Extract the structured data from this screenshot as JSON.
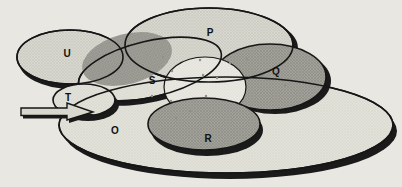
{
  "diagram": {
    "colors": {
      "paper": "#e8e7e1",
      "outline": "#161616",
      "shadow": "#1a1a1a",
      "label": "#111111",
      "speck": "#90908a",
      "arrow_fill": "#d8d8cf"
    },
    "patterns": {
      "hatchFaint": {
        "bg": "#e2e2da",
        "line": "#d8d8cf"
      },
      "hatchLight": {
        "bg": "#d8d8d0",
        "line": "#c8c8bd"
      },
      "hatchDark": {
        "bg": "#a2a29a",
        "line": "#8c8c83"
      },
      "hatchCenter": {
        "bg": "#e9e9e2",
        "line": "#e0e0d8"
      }
    },
    "sets": [
      {
        "id": "O",
        "label": "O",
        "phase": 1,
        "cx": 226,
        "cy": 125,
        "rx": 167,
        "ry": 48,
        "rot": 0,
        "fill": "hatchFaint",
        "stroke": true,
        "sw": 1.6,
        "shadow": {
          "dx": 4,
          "dy": 6
        },
        "label_x": 115,
        "label_y": 130
      },
      {
        "id": "U",
        "label": "U",
        "phase": 1,
        "cx": 70,
        "cy": 57,
        "rx": 53,
        "ry": 27,
        "rot": 0,
        "fill": "hatchLight",
        "stroke": true,
        "sw": 1.6,
        "shadow": {
          "dx": 2,
          "dy": 5
        },
        "label_x": 67,
        "label_y": 53
      },
      {
        "id": "S",
        "label": "S",
        "phase": 1,
        "cx": 150,
        "cy": 69,
        "rx": 73,
        "ry": 28,
        "rot": -13,
        "fill": "hatchFaint",
        "stroke": true,
        "sw": 1.6,
        "shadow": {
          "dx": 1,
          "dy": 5
        },
        "label_x": 152,
        "label_y": 80
      },
      {
        "id": "P",
        "label": "P",
        "phase": 1,
        "cx": 209,
        "cy": 45,
        "rx": 84,
        "ry": 37,
        "rot": 0,
        "fill": "hatchLight",
        "stroke": true,
        "sw": 1.6,
        "shadow": {
          "dx": 5,
          "dy": 3
        },
        "label_x": 210,
        "label_y": 32
      },
      {
        "id": "lens",
        "label": "",
        "phase": 1,
        "cx": 127,
        "cy": 59,
        "rx": 46,
        "ry": 25,
        "rot": -15,
        "fill": "hatchDark",
        "stroke": false,
        "sw": 0
      },
      {
        "id": "Q",
        "label": "Q",
        "phase": 1,
        "cx": 270,
        "cy": 77,
        "rx": 56,
        "ry": 33,
        "rot": 0,
        "fill": "hatchDark",
        "stroke": true,
        "sw": 1.6,
        "shadow": {
          "dx": 5,
          "dy": 4
        },
        "label_x": 276,
        "label_y": 71
      },
      {
        "id": "center",
        "label": "",
        "phase": 1,
        "cx": 205,
        "cy": 87,
        "rx": 41,
        "ry": 30,
        "rot": 0,
        "fill": "hatchCenter",
        "stroke": true,
        "sw": 1.2
      },
      {
        "id": "R",
        "label": "R",
        "phase": 1,
        "cx": 204,
        "cy": 124,
        "rx": 56,
        "ry": 26,
        "rot": 0,
        "fill": "hatchDark",
        "stroke": true,
        "sw": 1.6,
        "shadow": {
          "dx": 3,
          "dy": 6
        },
        "label_x": 208,
        "label_y": 138
      },
      {
        "id": "T",
        "label": "T",
        "phase": 2,
        "cx": 84,
        "cy": 100,
        "rx": 31,
        "ry": 16,
        "rot": 0,
        "fill": "hatchFaint",
        "stroke": true,
        "sw": 1.6,
        "shadow": {
          "dx": 4,
          "dy": 5
        },
        "label_x": 68,
        "label_y": 97
      }
    ],
    "restroke_mid": [
      "U",
      "S",
      "P"
    ],
    "restroke_top": [
      "O"
    ],
    "arrow": {
      "points": [
        [
          21,
          108
        ],
        [
          67,
          108
        ],
        [
          67,
          103
        ],
        [
          93,
          112
        ],
        [
          67,
          120
        ],
        [
          67,
          115.5
        ],
        [
          21,
          115.5
        ]
      ],
      "shadow_dx": 2,
      "shadow_dy": 3
    },
    "specks": [
      [
        163,
        57
      ],
      [
        172,
        71
      ],
      [
        200,
        60
      ],
      [
        203,
        75
      ],
      [
        217,
        78
      ],
      [
        230,
        63
      ],
      [
        152,
        96
      ],
      [
        171,
        101
      ],
      [
        206,
        96
      ],
      [
        176,
        118
      ],
      [
        190,
        111
      ],
      [
        247,
        59
      ],
      [
        262,
        76
      ],
      [
        285,
        85
      ]
    ]
  }
}
